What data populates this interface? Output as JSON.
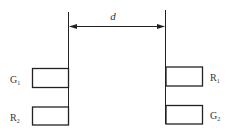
{
  "diagram": {
    "distance_label": "d",
    "left_components": [
      {
        "label": "G",
        "subscript": "1"
      },
      {
        "label": "R",
        "subscript": "2"
      }
    ],
    "right_components": [
      {
        "label": "R",
        "subscript": "1"
      },
      {
        "label": "G",
        "subscript": "2"
      }
    ],
    "colors": {
      "stroke": "#222222",
      "text": "#333333"
    }
  }
}
